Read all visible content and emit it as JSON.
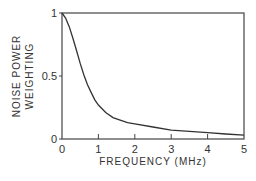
{
  "chart_data": {
    "type": "line",
    "title": "",
    "xlabel": "FREQUENCY  (MHz)",
    "ylabel_lines": [
      "NOISE POWER",
      "WEIGHTING"
    ],
    "ylabel": "NOISE POWER WEIGHTING",
    "xlim": [
      0,
      5
    ],
    "ylim": [
      0,
      1
    ],
    "x_ticks": [
      "0",
      "1",
      "2",
      "3",
      "4",
      "5"
    ],
    "y_ticks": [
      "0",
      "0.5",
      "1"
    ],
    "grid": false,
    "legend": null,
    "series": [
      {
        "name": "noise power weighting",
        "x": [
          0,
          0.1,
          0.2,
          0.3,
          0.4,
          0.5,
          0.6,
          0.7,
          0.8,
          0.9,
          1.0,
          1.2,
          1.4,
          1.6,
          1.8,
          2.0,
          2.5,
          3.0,
          3.5,
          4.0,
          4.5,
          5.0
        ],
        "y": [
          1.0,
          0.96,
          0.89,
          0.8,
          0.7,
          0.6,
          0.51,
          0.43,
          0.37,
          0.31,
          0.27,
          0.21,
          0.17,
          0.15,
          0.13,
          0.12,
          0.095,
          0.07,
          0.06,
          0.05,
          0.04,
          0.03
        ]
      }
    ]
  }
}
